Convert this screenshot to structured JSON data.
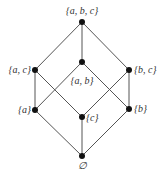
{
  "diagram": {
    "type": "hasse-diagram",
    "colors": {
      "edge": "#555555",
      "node": "#111111",
      "label": "#333333"
    },
    "nodes": [
      {
        "id": "abc",
        "label": "{a, b, c}",
        "x": 82,
        "y": 22,
        "lx": 82,
        "ly": 14,
        "anchor": "middle"
      },
      {
        "id": "ac",
        "label": "{a, c}",
        "x": 35,
        "y": 70,
        "lx": 31,
        "ly": 73,
        "anchor": "end"
      },
      {
        "id": "ab",
        "label": "{a, b}",
        "x": 82,
        "y": 62,
        "lx": 82,
        "ly": 84,
        "anchor": "middle"
      },
      {
        "id": "bc",
        "label": "{b, c}",
        "x": 129,
        "y": 70,
        "lx": 134,
        "ly": 73,
        "anchor": "start"
      },
      {
        "id": "a",
        "label": "{a}",
        "x": 35,
        "y": 110,
        "lx": 31,
        "ly": 113,
        "anchor": "end"
      },
      {
        "id": "c",
        "label": "{c}",
        "x": 82,
        "y": 117,
        "lx": 86,
        "ly": 121,
        "anchor": "start"
      },
      {
        "id": "b",
        "label": "{b}",
        "x": 129,
        "y": 109,
        "lx": 134,
        "ly": 112,
        "anchor": "start"
      },
      {
        "id": "empty",
        "label": "∅",
        "x": 82,
        "y": 156,
        "lx": 82,
        "ly": 169,
        "anchor": "middle"
      }
    ],
    "edges": [
      [
        "abc",
        "ac"
      ],
      [
        "abc",
        "ab"
      ],
      [
        "abc",
        "bc"
      ],
      [
        "ac",
        "a"
      ],
      [
        "ac",
        "c"
      ],
      [
        "ab",
        "a"
      ],
      [
        "ab",
        "b"
      ],
      [
        "bc",
        "c"
      ],
      [
        "bc",
        "b"
      ],
      [
        "a",
        "empty"
      ],
      [
        "c",
        "empty"
      ],
      [
        "b",
        "empty"
      ]
    ]
  }
}
